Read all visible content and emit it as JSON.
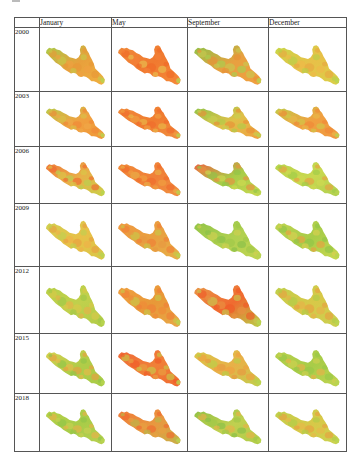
{
  "figure": {
    "columns": [
      "January",
      "May",
      "September",
      "December"
    ],
    "rows": [
      {
        "year": "2000",
        "cells": [
          {
            "base": [
              "#a8cc4a",
              "#e8a03c",
              "#f0b040"
            ],
            "patches": [
              "#e89838",
              "#c8c848",
              "#f0a040"
            ]
          },
          {
            "base": [
              "#f08a3a",
              "#f07a30",
              "#f58a38"
            ],
            "patches": [
              "#f06a28",
              "#f58038",
              "#e8c050"
            ]
          },
          {
            "base": [
              "#8cc448",
              "#e8a040",
              "#f0a040"
            ],
            "patches": [
              "#c8c850",
              "#e89038",
              "#a8d050"
            ]
          },
          {
            "base": [
              "#c8d848",
              "#e8c048",
              "#d8d048"
            ],
            "patches": [
              "#e8a840",
              "#b8d048",
              "#f0b848"
            ]
          }
        ]
      },
      {
        "year": "2003",
        "cells": [
          {
            "base": [
              "#b8cc4c",
              "#f0a040",
              "#f09838"
            ],
            "patches": [
              "#f08838",
              "#d8c048",
              "#f0a848"
            ]
          },
          {
            "base": [
              "#f08a3a",
              "#f07c30",
              "#f09040"
            ],
            "patches": [
              "#f06c2c",
              "#f0a040",
              "#e8b848"
            ]
          },
          {
            "base": [
              "#90c44a",
              "#e0c048",
              "#f0a040"
            ],
            "patches": [
              "#e89038",
              "#c8d050",
              "#b0cc48"
            ]
          },
          {
            "base": [
              "#c0cc4a",
              "#f0a040",
              "#f09840"
            ],
            "patches": [
              "#f08838",
              "#e8b848",
              "#d0c848"
            ]
          }
        ]
      },
      {
        "year": "2006",
        "cells": [
          {
            "base": [
              "#f07838",
              "#e8b048",
              "#c8d048"
            ],
            "patches": [
              "#f06a30",
              "#d8c848",
              "#b8d050"
            ]
          },
          {
            "base": [
              "#f08a38",
              "#f08038",
              "#f09040"
            ],
            "patches": [
              "#f06c2c",
              "#e8b048",
              "#f0a040"
            ]
          },
          {
            "base": [
              "#f06040",
              "#a8cc48",
              "#c8d850"
            ],
            "patches": [
              "#e89040",
              "#90c448",
              "#d0d850"
            ]
          },
          {
            "base": [
              "#b8d44c",
              "#c8d850",
              "#b0d050"
            ],
            "patches": [
              "#e8a040",
              "#a0cc48",
              "#d0d850"
            ]
          }
        ]
      },
      {
        "year": "2009",
        "cells": [
          {
            "base": [
              "#d0d050",
              "#e8c048",
              "#d8c848"
            ],
            "patches": [
              "#e8a040",
              "#c0d050",
              "#f0b048"
            ]
          },
          {
            "base": [
              "#f09840",
              "#e8a040",
              "#e8b048"
            ],
            "patches": [
              "#f08038",
              "#c8c848",
              "#e89840"
            ]
          },
          {
            "base": [
              "#90c448",
              "#b0d050",
              "#c0d450"
            ],
            "patches": [
              "#a0c848",
              "#d0d050",
              "#88c048"
            ]
          },
          {
            "base": [
              "#c0d450",
              "#a8cc48",
              "#c8d850"
            ],
            "patches": [
              "#90c448",
              "#d8d050",
              "#e8a040"
            ]
          }
        ]
      },
      {
        "year": "2012",
        "cells": [
          {
            "base": [
              "#b8d048",
              "#c0d04c",
              "#b0cc48"
            ],
            "patches": [
              "#d8c848",
              "#a0c848",
              "#e8b048"
            ]
          },
          {
            "base": [
              "#f0a040",
              "#e89838",
              "#e8a848"
            ],
            "patches": [
              "#f08038",
              "#c8c848",
              "#f08a38"
            ]
          },
          {
            "base": [
              "#e89848",
              "#f06a30",
              "#b8d048"
            ],
            "patches": [
              "#f05a28",
              "#c8c850",
              "#e89040"
            ]
          },
          {
            "base": [
              "#c0d04c",
              "#d8c848",
              "#c8d050"
            ],
            "patches": [
              "#e8a040",
              "#b0cc48",
              "#e8b048"
            ]
          }
        ]
      },
      {
        "year": "2015",
        "cells": [
          {
            "base": [
              "#d8d050",
              "#b0cc48",
              "#a8cc48"
            ],
            "patches": [
              "#e8a040",
              "#90c448",
              "#e8b848"
            ]
          },
          {
            "base": [
              "#f06838",
              "#f08038",
              "#f06a30"
            ],
            "patches": [
              "#c8c848",
              "#f05a28",
              "#e8a040"
            ]
          },
          {
            "base": [
              "#d8c848",
              "#e8b048",
              "#c0d04c"
            ],
            "patches": [
              "#f0a040",
              "#b8d048",
              "#e89840"
            ]
          },
          {
            "base": [
              "#b8d04c",
              "#a8cc48",
              "#c0d450"
            ],
            "patches": [
              "#98c848",
              "#d0d050",
              "#e8b048"
            ]
          }
        ]
      },
      {
        "year": "2018",
        "cells": [
          {
            "base": [
              "#b8d048",
              "#a8cc48",
              "#b8d050"
            ],
            "patches": [
              "#e8b048",
              "#90c448",
              "#c8d050"
            ]
          },
          {
            "base": [
              "#f07838",
              "#e89840",
              "#c8b048"
            ],
            "patches": [
              "#f06a30",
              "#b8b848",
              "#e8a040"
            ]
          },
          {
            "base": [
              "#90c044",
              "#c0d050",
              "#b0cc48"
            ],
            "patches": [
              "#e8b048",
              "#a0c848",
              "#88c048"
            ]
          },
          {
            "base": [
              "#c0d04c",
              "#d8c848",
              "#c8d450"
            ],
            "patches": [
              "#e8a040",
              "#b0cc48",
              "#e8b848"
            ]
          }
        ]
      }
    ]
  }
}
